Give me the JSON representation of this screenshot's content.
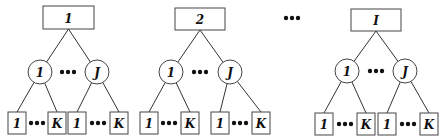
{
  "diagram": {
    "title": "",
    "colors": {
      "stroke": "#444444",
      "text": "#111111",
      "background": "#ffffff"
    },
    "separator_dots": {
      "x": 292,
      "y": 18,
      "label": "•••"
    },
    "trees": [
      {
        "root": {
          "label": "1",
          "x": 43,
          "y": 6,
          "w": 51,
          "h": 23
        },
        "middle_nodes": [
          {
            "label": "1",
            "cx": 40,
            "cy": 72,
            "r": 12
          },
          {
            "label": "J",
            "cx": 97,
            "cy": 72,
            "r": 12
          }
        ],
        "middle_dots": {
          "cx": 68,
          "cy": 72
        },
        "leaf_groups": [
          {
            "leaves": [
              {
                "label": "1",
                "x": 8,
                "y": 112
              },
              {
                "label": "K",
                "x": 48,
                "y": 112
              }
            ],
            "dots": {
              "cx": 37,
              "cy": 123
            }
          },
          {
            "leaves": [
              {
                "label": "1",
                "x": 68,
                "y": 112
              },
              {
                "label": "K",
                "x": 110,
                "y": 112
              }
            ],
            "dots": {
              "cx": 98,
              "cy": 123
            }
          }
        ]
      },
      {
        "root": {
          "label": "2",
          "x": 175,
          "y": 8,
          "w": 50,
          "h": 22
        },
        "middle_nodes": [
          {
            "label": "1",
            "cx": 171,
            "cy": 72,
            "r": 12
          },
          {
            "label": "J",
            "cx": 230,
            "cy": 72,
            "r": 12
          }
        ],
        "middle_dots": {
          "cx": 200,
          "cy": 72
        },
        "leaf_groups": [
          {
            "leaves": [
              {
                "label": "1",
                "x": 140,
                "y": 112
              },
              {
                "label": "K",
                "x": 181,
                "y": 112
              }
            ],
            "dots": {
              "cx": 169,
              "cy": 123
            }
          },
          {
            "leaves": [
              {
                "label": "1",
                "x": 211,
                "y": 112
              },
              {
                "label": "K",
                "x": 252,
                "y": 112
              }
            ],
            "dots": {
              "cx": 240,
              "cy": 123
            }
          }
        ]
      },
      {
        "root": {
          "label": "I",
          "x": 351,
          "y": 9,
          "w": 50,
          "h": 22
        },
        "middle_nodes": [
          {
            "label": "1",
            "cx": 347,
            "cy": 71,
            "r": 12
          },
          {
            "label": "J",
            "cx": 405,
            "cy": 71,
            "r": 12
          }
        ],
        "middle_dots": {
          "cx": 376,
          "cy": 71
        },
        "leaf_groups": [
          {
            "leaves": [
              {
                "label": "1",
                "x": 315,
                "y": 113
              },
              {
                "label": "K",
                "x": 357,
                "y": 113
              }
            ],
            "dots": {
              "cx": 345,
              "cy": 124
            }
          },
          {
            "leaves": [
              {
                "label": "1",
                "x": 378,
                "y": 113
              },
              {
                "label": "K",
                "x": 420,
                "y": 113
              }
            ],
            "dots": {
              "cx": 408,
              "cy": 124
            }
          }
        ]
      }
    ],
    "leaf_size": {
      "w": 18,
      "h": 22
    }
  }
}
